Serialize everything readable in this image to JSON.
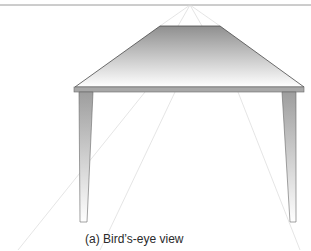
{
  "figure": {
    "caption": "(a) Bird’s-eye view",
    "elements": [
      "horizon-line",
      "vanishing-point",
      "perspective-guidelines",
      "tabletop",
      "table-edge",
      "left-leg",
      "right-leg"
    ]
  },
  "colors": {
    "horizon": "#9a9a9a",
    "guidelines": "#d8d8d8",
    "tabletop_dark": "#8f8f8f",
    "tabletop_light": "#ffffff",
    "edge": "#a8a8a8",
    "outline": "#4a4a4a"
  }
}
